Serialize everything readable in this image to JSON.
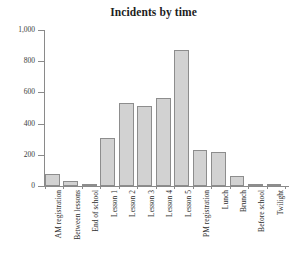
{
  "chart_data": {
    "type": "bar",
    "title": "Incidents by time",
    "xlabel": "",
    "ylabel": "",
    "ylim": [
      0,
      1000
    ],
    "grid": false,
    "legend": "none",
    "yticks": [
      "0",
      "200",
      "400",
      "600",
      "800",
      "1,000"
    ],
    "ytick_values": [
      0,
      200,
      400,
      600,
      800,
      1000
    ],
    "categories": [
      "AM registration",
      "Between lessons",
      "End of school",
      "Lesson 1",
      "Lesson 2",
      "Lesson 3",
      "Lesson 4",
      "Lesson 5",
      "PM registration",
      "Lunch",
      "Brunch",
      "Before school",
      "Twilight"
    ],
    "values": [
      75,
      35,
      10,
      310,
      530,
      515,
      565,
      870,
      230,
      215,
      65,
      15,
      5
    ],
    "bar_fill": "#d2d2d2",
    "bar_stroke": "#8d8d8d",
    "axis_color": "#8a8a8a"
  }
}
